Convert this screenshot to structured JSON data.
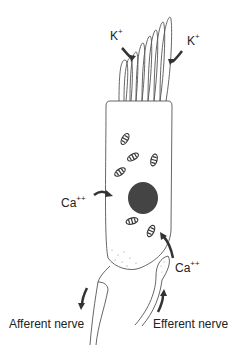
{
  "diagram": {
    "colors": {
      "line": "#555555",
      "arrow": "#333333",
      "nucleus": "#444444"
    },
    "labels": {
      "k_left": {
        "base": "K",
        "sup": "+"
      },
      "k_right": {
        "base": "K",
        "sup": "+"
      },
      "ca_left": {
        "base": "Ca",
        "sup": "++"
      },
      "ca_right": {
        "base": "Ca",
        "sup": "++"
      },
      "afferent": "Afferent nerve",
      "efferent": "Efferent nerve"
    }
  }
}
